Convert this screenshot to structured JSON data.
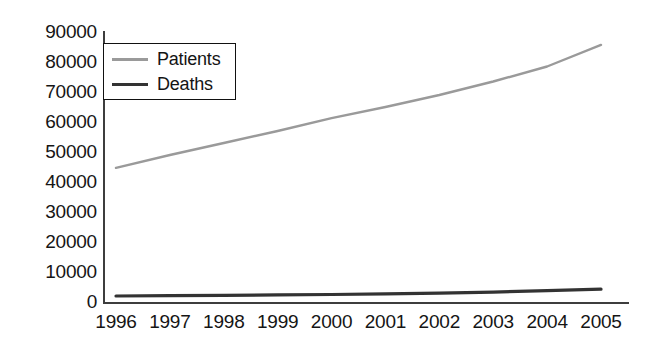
{
  "chart_data": {
    "type": "line",
    "title": "",
    "xlabel": "",
    "ylabel": "",
    "x": [
      1996,
      1997,
      1998,
      1999,
      2000,
      2001,
      2002,
      2003,
      2004,
      2005
    ],
    "categories": [
      "1996",
      "1997",
      "1998",
      "1999",
      "2000",
      "2001",
      "2002",
      "2003",
      "2004",
      "2005"
    ],
    "series": [
      {
        "name": "Patients",
        "color": "#9a9a9a",
        "values": [
          44700,
          49000,
          53000,
          57000,
          61300,
          65000,
          69000,
          73500,
          78500,
          85700
        ]
      },
      {
        "name": "Deaths",
        "color": "#333333",
        "values": [
          2000,
          2100,
          2200,
          2350,
          2500,
          2700,
          2950,
          3300,
          3800,
          4300
        ]
      }
    ],
    "ylim": [
      0,
      90000
    ],
    "xlim": [
      1996,
      2005
    ],
    "yticks": [
      0,
      10000,
      20000,
      30000,
      40000,
      50000,
      60000,
      70000,
      80000,
      90000
    ],
    "ytick_labels": [
      "0",
      "10000",
      "20000",
      "30000",
      "40000",
      "50000",
      "60000",
      "70000",
      "80000",
      "90000"
    ],
    "grid": false,
    "legend_position": "upper-left"
  },
  "legend": {
    "entries": [
      {
        "label": "Patients",
        "color": "#9a9a9a"
      },
      {
        "label": "Deaths",
        "color": "#333333"
      }
    ]
  },
  "axes": {
    "y_tick_labels": [
      "90000",
      "80000",
      "70000",
      "60000",
      "50000",
      "40000",
      "30000",
      "20000",
      "10000",
      "0"
    ],
    "x_tick_labels": [
      "1996",
      "1997",
      "1998",
      "1999",
      "2000",
      "2001",
      "2002",
      "2003",
      "2004",
      "2005"
    ]
  },
  "geometry": {
    "plot_left": 116,
    "plot_right": 601,
    "y_zero_px": 302,
    "px_per_unit": 0.003
  }
}
